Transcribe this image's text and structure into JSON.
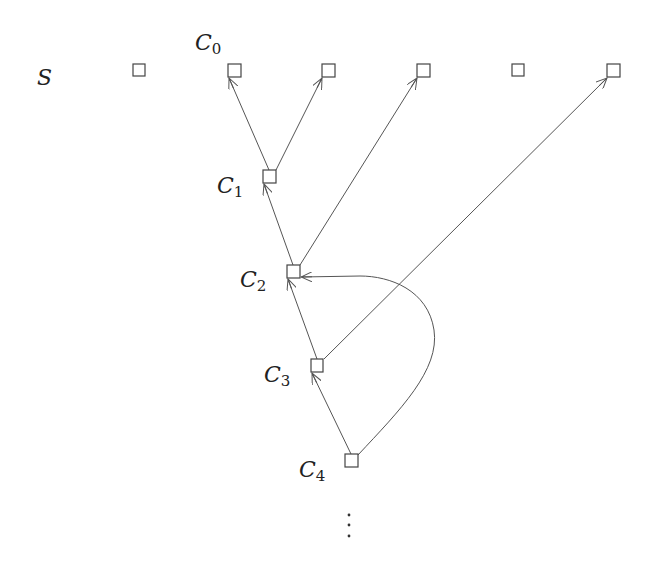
{
  "diagram": {
    "type": "directed-graph",
    "labels": {
      "S": "S",
      "C0": {
        "base": "C",
        "sub": "0"
      },
      "C1": {
        "base": "C",
        "sub": "1"
      },
      "C2": {
        "base": "C",
        "sub": "2"
      },
      "C3": {
        "base": "C",
        "sub": "3"
      },
      "C4": {
        "base": "C",
        "sub": "4"
      }
    },
    "continuation": "⋮",
    "nodes": [
      {
        "id": "s0",
        "row": "S",
        "x": 133,
        "y": 64
      },
      {
        "id": "C0",
        "row": "S",
        "x": 228,
        "y": 64
      },
      {
        "id": "s2",
        "row": "S",
        "x": 322,
        "y": 64
      },
      {
        "id": "s3",
        "row": "S",
        "x": 417,
        "y": 64
      },
      {
        "id": "s4",
        "row": "S",
        "x": 512,
        "y": 64
      },
      {
        "id": "s5",
        "row": "S",
        "x": 607,
        "y": 64
      },
      {
        "id": "C1",
        "x": 263,
        "y": 170
      },
      {
        "id": "C2",
        "x": 287,
        "y": 265
      },
      {
        "id": "C3",
        "x": 311,
        "y": 359
      },
      {
        "id": "C4",
        "x": 345,
        "y": 454
      }
    ],
    "edges": [
      {
        "from": "C1",
        "to": "C0"
      },
      {
        "from": "C1",
        "to": "s2"
      },
      {
        "from": "C2",
        "to": "C1"
      },
      {
        "from": "C2",
        "to": "s3"
      },
      {
        "from": "C3",
        "to": "C2"
      },
      {
        "from": "C3",
        "to": "s5"
      },
      {
        "from": "C4",
        "to": "C3"
      },
      {
        "from": "C4",
        "to": "C2",
        "curved": true
      }
    ]
  }
}
